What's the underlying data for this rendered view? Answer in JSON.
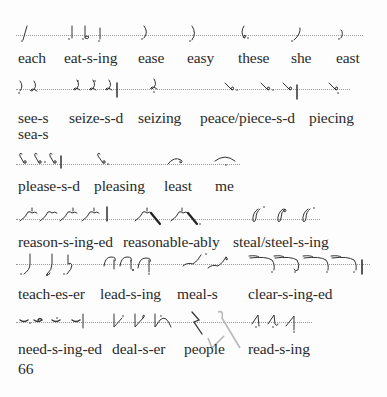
{
  "page": {
    "type": "shorthand-textbook-page",
    "page_number": "66",
    "rows": [
      {
        "rule_y": 35,
        "label_y": 50,
        "rule_x": [
          16,
          363
        ],
        "words": [
          {
            "label": "each",
            "x": 18
          },
          {
            "label": "eat-s-ing",
            "x": 64
          },
          {
            "label": "ease",
            "x": 138
          },
          {
            "label": "easy",
            "x": 187
          },
          {
            "label": "these",
            "x": 238
          },
          {
            "label": "she",
            "x": 291
          },
          {
            "label": "east",
            "x": 336
          }
        ]
      },
      {
        "rule_y": 89,
        "label_y": 110,
        "rule_x": [
          16,
          350
        ],
        "words": [
          {
            "label": "see-s",
            "x": 18
          },
          {
            "label": "seize-s-d",
            "x": 69
          },
          {
            "label": "seizing",
            "x": 138
          },
          {
            "label": "peace/piece-s-d",
            "x": 200
          },
          {
            "label": "piecing",
            "x": 309
          }
        ],
        "extra_labels": [
          {
            "label": "sea-s",
            "x": 18,
            "y": 126
          }
        ]
      },
      {
        "rule_y": 164,
        "label_y": 178,
        "rule_x": [
          16,
          240
        ],
        "words": [
          {
            "label": "please-s-d",
            "x": 18
          },
          {
            "label": "pleasing",
            "x": 94
          },
          {
            "label": "least",
            "x": 164
          },
          {
            "label": "me",
            "x": 215
          }
        ]
      },
      {
        "rule_y": 219,
        "label_y": 234,
        "rule_x": [
          16,
          320
        ],
        "words": [
          {
            "label": "reason-s-ing-ed",
            "x": 18
          },
          {
            "label": "reasonable-ably",
            "x": 123
          },
          {
            "label": "steal/steel-s-ing",
            "x": 233
          }
        ]
      },
      {
        "rule_y": 264,
        "label_y": 286,
        "rule_x": [
          16,
          370
        ],
        "words": [
          {
            "label": "teach-es-er",
            "x": 18
          },
          {
            "label": "lead-s-ing",
            "x": 100
          },
          {
            "label": "meal-s",
            "x": 177
          },
          {
            "label": "clear-s-ing-ed",
            "x": 248
          }
        ]
      },
      {
        "rule_y": 322,
        "label_y": 341,
        "rule_x": [
          16,
          312
        ],
        "words": [
          {
            "label": "need-s-ing-ed",
            "x": 18
          },
          {
            "label": "deal-s-er",
            "x": 112
          },
          {
            "label": "people",
            "x": 184
          },
          {
            "label": "read-s-ing",
            "x": 248
          }
        ]
      }
    ]
  },
  "labels": {
    "r1": [
      "each",
      "eat-s-ing",
      "ease",
      "easy",
      "these",
      "she",
      "east"
    ],
    "r2": [
      "see-s",
      "seize-s-d",
      "seizing",
      "peace/piece-s-d",
      "piecing",
      "sea-s"
    ],
    "r3": [
      "please-s-d",
      "pleasing",
      "least",
      "me"
    ],
    "r4": [
      "reason-s-ing-ed",
      "reasonable-ably",
      "steal/steel-s-ing"
    ],
    "r5": [
      "teach-es-er",
      "lead-s-ing",
      "meal-s",
      "clear-s-ing-ed"
    ],
    "r6": [
      "need-s-ing-ed",
      "deal-s-er",
      "people",
      "read-s-ing"
    ]
  },
  "icons": {
    "shorthand_outline": "shorthand-outline-glyph",
    "pencil_mark": "pencil-annotation-mark"
  },
  "colors": {
    "ink": "#2a2a2a",
    "rule": "#9a9a9a",
    "pencil": "#b8b8b8",
    "paper": "#fdfdfd"
  }
}
